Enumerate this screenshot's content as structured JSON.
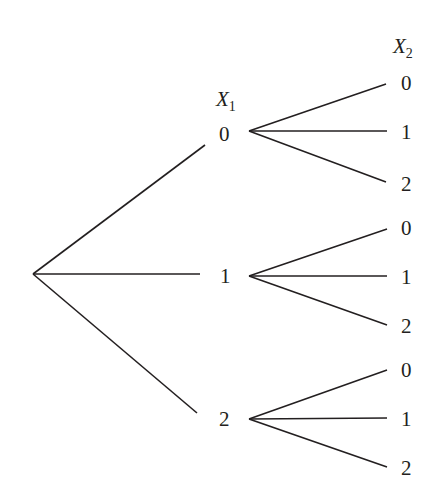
{
  "diagram": {
    "type": "tree",
    "root": {
      "x": 33,
      "y": 274
    },
    "level1_header": {
      "var": "X",
      "sub": "1"
    },
    "level2_header": {
      "var": "X",
      "sub": "2"
    },
    "level1": [
      {
        "label": "0",
        "children": [
          "0",
          "1",
          "2"
        ]
      },
      {
        "label": "1",
        "children": [
          "0",
          "1",
          "2"
        ]
      },
      {
        "label": "2",
        "children": [
          "0",
          "1",
          "2"
        ]
      }
    ],
    "colors": {
      "ink": "#231f20",
      "background": "#ffffff"
    }
  }
}
